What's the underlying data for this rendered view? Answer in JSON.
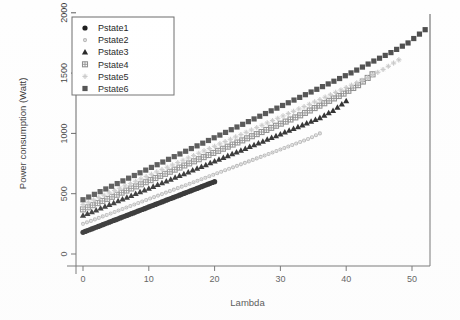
{
  "chart_data": {
    "type": "scatter",
    "title": "",
    "xlabel": "Lambda",
    "ylabel": "Power consumption (Watt)",
    "xlim": [
      -2,
      53
    ],
    "ylim": [
      -60,
      2150
    ],
    "xticks": [
      0,
      10,
      20,
      30,
      40,
      50
    ],
    "yticks": [
      0,
      500,
      1000,
      1500,
      2000
    ],
    "xtick_labels": [
      "0",
      "10",
      "20",
      "30",
      "40",
      "50"
    ],
    "ytick_labels": [
      "0",
      "500",
      "1000",
      "1500",
      "2000"
    ],
    "grid": false,
    "legend_position": "top-left",
    "series": [
      {
        "name": "Pstate1",
        "marker": "filled-circle",
        "color": "#1a1a1a",
        "x": [
          0,
          1,
          2,
          3,
          4,
          5,
          6,
          7,
          8,
          9,
          10,
          11,
          12,
          13,
          14,
          15,
          16,
          17,
          18,
          19,
          20
        ],
        "y": [
          180,
          201,
          222,
          243,
          264,
          285,
          306,
          327,
          348,
          369,
          390,
          411,
          432,
          453,
          474,
          495,
          516,
          537,
          558,
          579,
          600
        ]
      },
      {
        "name": "Pstate2",
        "marker": "small-dot",
        "color": "#b4b4b4",
        "x": [
          0,
          1.8,
          3.6,
          5.4,
          7.2,
          9,
          10.8,
          12.6,
          14.4,
          16.2,
          18,
          19.8,
          21.6,
          23.4,
          25.2,
          27,
          28.8,
          30.6,
          32.4,
          34.2,
          36
        ],
        "y": [
          250,
          287,
          324,
          361,
          398,
          435,
          472,
          509,
          546,
          583,
          620,
          657,
          694,
          731,
          768,
          805,
          842,
          879,
          916,
          953,
          1000
        ]
      },
      {
        "name": "Pstate3",
        "marker": "filled-triangle",
        "color": "#222222",
        "x": [
          0,
          2,
          4,
          6,
          8,
          10,
          12,
          14,
          16,
          18,
          20,
          22,
          24,
          26,
          28,
          30,
          32,
          34,
          36,
          38,
          40
        ],
        "y": [
          320,
          365,
          410,
          455,
          500,
          545,
          590,
          635,
          680,
          725,
          770,
          815,
          860,
          905,
          950,
          995,
          1040,
          1085,
          1130,
          1190,
          1270
        ]
      },
      {
        "name": "Pstate4",
        "marker": "grid-square",
        "color": "#8a8a8a",
        "x": [
          0,
          2.2,
          4.4,
          6.6,
          8.8,
          11,
          13.2,
          15.4,
          17.6,
          19.8,
          22,
          24.2,
          26.4,
          28.6,
          30.8,
          33,
          35.2,
          37.4,
          39.6,
          41.8,
          44
        ],
        "y": [
          370,
          422,
          474,
          526,
          578,
          630,
          682,
          734,
          786,
          838,
          890,
          942,
          994,
          1046,
          1098,
          1150,
          1210,
          1270,
          1330,
          1400,
          1490
        ]
      },
      {
        "name": "Pstate5",
        "marker": "light-plus",
        "color": "#c8c8c8",
        "x": [
          0,
          2.4,
          4.8,
          7.2,
          9.6,
          12,
          14.4,
          16.8,
          19.2,
          21.6,
          24,
          26.4,
          28.8,
          31.2,
          33.6,
          36,
          38.4,
          40.8,
          43.2,
          45.6,
          48
        ],
        "y": [
          410,
          468,
          526,
          584,
          642,
          700,
          758,
          816,
          874,
          932,
          990,
          1048,
          1106,
          1164,
          1222,
          1280,
          1340,
          1400,
          1460,
          1530,
          1610
        ]
      },
      {
        "name": "Pstate6",
        "marker": "filled-square",
        "color": "#4a4a4a",
        "x": [
          0,
          2.6,
          5.2,
          7.8,
          10.4,
          13,
          15.6,
          18.2,
          20.8,
          23.4,
          26,
          28.6,
          31.2,
          33.8,
          36.4,
          39,
          41.6,
          44.2,
          46.8,
          49.4,
          52
        ],
        "y": [
          450,
          517,
          584,
          651,
          718,
          785,
          852,
          919,
          986,
          1053,
          1120,
          1187,
          1254,
          1321,
          1388,
          1455,
          1525,
          1600,
          1670,
          1750,
          1860
        ]
      }
    ]
  },
  "legend": {
    "entries": [
      {
        "label": "Pstate1"
      },
      {
        "label": "Pstate2"
      },
      {
        "label": "Pstate3"
      },
      {
        "label": "Pstate4"
      },
      {
        "label": "Pstate5"
      },
      {
        "label": "Pstate6"
      }
    ]
  }
}
